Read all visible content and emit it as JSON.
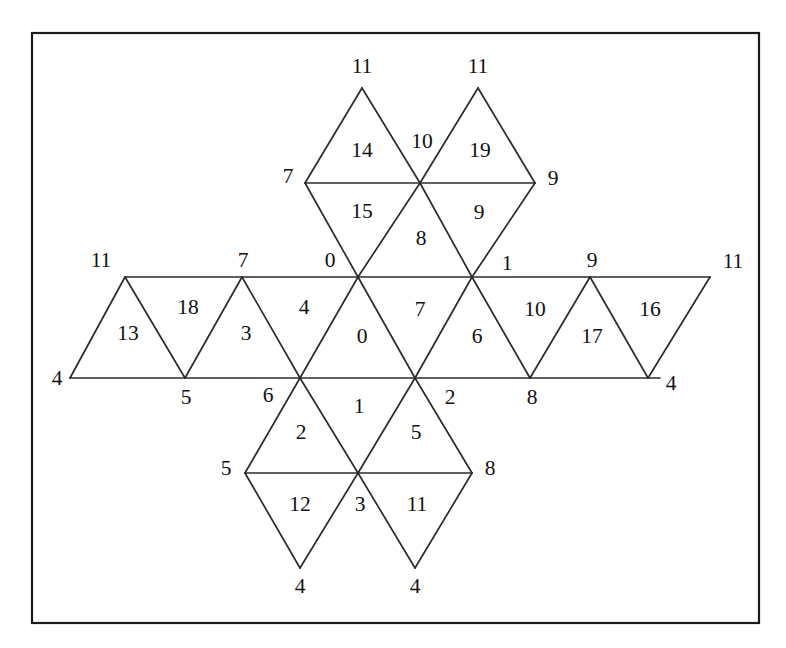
{
  "figure": {
    "type": "triangulated-mesh",
    "background_color": "#ffffff",
    "line_color": "#2b2b2b",
    "text_color": "#111111",
    "frame": {
      "x": 32,
      "y": 33,
      "width": 727,
      "height": 590
    }
  },
  "mesh_data": {
    "type": "diagram",
    "description": "Star-shaped triangulated mesh with numbered vertices (outside labels) and numbered triangular faces (inside labels)",
    "vertex_labels": [
      {
        "id": "v-top-left-apex",
        "text": "11",
        "x": 362,
        "y": 68
      },
      {
        "id": "v-top-right-apex",
        "text": "11",
        "x": 478,
        "y": 68
      },
      {
        "id": "v-upper-left",
        "text": "7",
        "x": 288,
        "y": 178
      },
      {
        "id": "v-upper-right",
        "text": "9",
        "x": 553,
        "y": 180
      },
      {
        "id": "v-strip-left-end-top",
        "text": "11",
        "x": 101,
        "y": 262
      },
      {
        "id": "v-strip-top-7",
        "text": "7",
        "x": 243,
        "y": 262
      },
      {
        "id": "v-center-top-left",
        "text": "0",
        "x": 330,
        "y": 262
      },
      {
        "id": "v-center-top-right",
        "text": "1",
        "x": 507,
        "y": 265
      },
      {
        "id": "v-strip-top-9",
        "text": "9",
        "x": 592,
        "y": 262
      },
      {
        "id": "v-strip-right-end-top",
        "text": "11",
        "x": 733,
        "y": 263
      },
      {
        "id": "v-strip-left-end-bot",
        "text": "4",
        "x": 57,
        "y": 380
      },
      {
        "id": "v-strip-bot-5",
        "text": "5",
        "x": 186,
        "y": 399
      },
      {
        "id": "v-strip-bot-6",
        "text": "6",
        "x": 268,
        "y": 397
      },
      {
        "id": "v-strip-bot-2",
        "text": "2",
        "x": 450,
        "y": 399
      },
      {
        "id": "v-strip-bot-8",
        "text": "8",
        "x": 532,
        "y": 399
      },
      {
        "id": "v-strip-right-end-bot",
        "text": "4",
        "x": 671,
        "y": 385
      },
      {
        "id": "v-lower-left",
        "text": "5",
        "x": 226,
        "y": 470
      },
      {
        "id": "v-lower-right",
        "text": "8",
        "x": 490,
        "y": 470
      },
      {
        "id": "v-bot-left-apex",
        "text": "4",
        "x": 300,
        "y": 588
      },
      {
        "id": "v-bot-right-apex",
        "text": "4",
        "x": 415,
        "y": 588
      }
    ],
    "face_labels": [
      {
        "id": "f-14",
        "text": "14",
        "x": 362,
        "y": 152
      },
      {
        "id": "f-10",
        "text": "10",
        "x": 422,
        "y": 143
      },
      {
        "id": "f-19",
        "text": "19",
        "x": 480,
        "y": 152
      },
      {
        "id": "f-15",
        "text": "15",
        "x": 362,
        "y": 213
      },
      {
        "id": "f-9",
        "text": "9",
        "x": 479,
        "y": 214
      },
      {
        "id": "f-8",
        "text": "8",
        "x": 421,
        "y": 240
      },
      {
        "id": "f-13",
        "text": "13",
        "x": 128,
        "y": 335
      },
      {
        "id": "f-18",
        "text": "18",
        "x": 188,
        "y": 309
      },
      {
        "id": "f-3",
        "text": "3",
        "x": 246,
        "y": 335
      },
      {
        "id": "f-4",
        "text": "4",
        "x": 304,
        "y": 309
      },
      {
        "id": "f-0",
        "text": "0",
        "x": 362,
        "y": 338
      },
      {
        "id": "f-7",
        "text": "7",
        "x": 420,
        "y": 311
      },
      {
        "id": "f-6",
        "text": "6",
        "x": 477,
        "y": 338
      },
      {
        "id": "f-10b",
        "text": "10",
        "x": 535,
        "y": 311
      },
      {
        "id": "f-17",
        "text": "17",
        "x": 592,
        "y": 338
      },
      {
        "id": "f-16",
        "text": "16",
        "x": 650,
        "y": 311
      },
      {
        "id": "f-2",
        "text": "2",
        "x": 301,
        "y": 434
      },
      {
        "id": "f-1",
        "text": "1",
        "x": 359,
        "y": 408
      },
      {
        "id": "f-5",
        "text": "5",
        "x": 416,
        "y": 434
      },
      {
        "id": "f-12",
        "text": "12",
        "x": 300,
        "y": 506
      },
      {
        "id": "f-3b",
        "text": "3",
        "x": 360,
        "y": 506
      },
      {
        "id": "f-11",
        "text": "11",
        "x": 417,
        "y": 506
      }
    ],
    "edges": [
      {
        "id": "e-strip-top",
        "x1": 125,
        "y1": 277,
        "x2": 710,
        "y2": 277
      },
      {
        "id": "e-strip-bot",
        "x1": 70,
        "y1": 378,
        "x2": 660,
        "y2": 378
      },
      {
        "id": "e-upper-mid",
        "x1": 305,
        "y1": 183,
        "x2": 535,
        "y2": 183
      },
      {
        "id": "e-lower-mid",
        "x1": 245,
        "y1": 473,
        "x2": 472,
        "y2": 473
      },
      {
        "id": "e-s1",
        "x1": 125,
        "y1": 277,
        "x2": 70,
        "y2": 378
      },
      {
        "id": "e-s2",
        "x1": 125,
        "y1": 277,
        "x2": 185,
        "y2": 378
      },
      {
        "id": "e-s3",
        "x1": 242,
        "y1": 277,
        "x2": 185,
        "y2": 378
      },
      {
        "id": "e-s4",
        "x1": 242,
        "y1": 277,
        "x2": 300,
        "y2": 378
      },
      {
        "id": "e-s5",
        "x1": 358,
        "y1": 277,
        "x2": 300,
        "y2": 378
      },
      {
        "id": "e-s6",
        "x1": 358,
        "y1": 277,
        "x2": 415,
        "y2": 378
      },
      {
        "id": "e-s7",
        "x1": 472,
        "y1": 277,
        "x2": 415,
        "y2": 378
      },
      {
        "id": "e-s8",
        "x1": 472,
        "y1": 277,
        "x2": 530,
        "y2": 378
      },
      {
        "id": "e-s9",
        "x1": 590,
        "y1": 277,
        "x2": 530,
        "y2": 378
      },
      {
        "id": "e-s10",
        "x1": 590,
        "y1": 277,
        "x2": 648,
        "y2": 378
      },
      {
        "id": "e-s11",
        "x1": 710,
        "y1": 277,
        "x2": 648,
        "y2": 378
      },
      {
        "id": "e-t1",
        "x1": 362,
        "y1": 88,
        "x2": 305,
        "y2": 183
      },
      {
        "id": "e-t2",
        "x1": 362,
        "y1": 88,
        "x2": 420,
        "y2": 183
      },
      {
        "id": "e-t3",
        "x1": 478,
        "y1": 88,
        "x2": 420,
        "y2": 183
      },
      {
        "id": "e-t4",
        "x1": 478,
        "y1": 88,
        "x2": 535,
        "y2": 183
      },
      {
        "id": "e-t5",
        "x1": 305,
        "y1": 183,
        "x2": 358,
        "y2": 277
      },
      {
        "id": "e-t6",
        "x1": 420,
        "y1": 183,
        "x2": 358,
        "y2": 277
      },
      {
        "id": "e-t7",
        "x1": 420,
        "y1": 183,
        "x2": 472,
        "y2": 277
      },
      {
        "id": "e-t8",
        "x1": 535,
        "y1": 183,
        "x2": 472,
        "y2": 277
      },
      {
        "id": "e-b1",
        "x1": 300,
        "y1": 378,
        "x2": 245,
        "y2": 473
      },
      {
        "id": "e-b2",
        "x1": 300,
        "y1": 378,
        "x2": 358,
        "y2": 473
      },
      {
        "id": "e-b3",
        "x1": 415,
        "y1": 378,
        "x2": 358,
        "y2": 473
      },
      {
        "id": "e-b4",
        "x1": 415,
        "y1": 378,
        "x2": 472,
        "y2": 473
      },
      {
        "id": "e-b5",
        "x1": 245,
        "y1": 473,
        "x2": 300,
        "y2": 568
      },
      {
        "id": "e-b6",
        "x1": 358,
        "y1": 473,
        "x2": 300,
        "y2": 568
      },
      {
        "id": "e-b7",
        "x1": 358,
        "y1": 473,
        "x2": 415,
        "y2": 568
      },
      {
        "id": "e-b8",
        "x1": 472,
        "y1": 473,
        "x2": 415,
        "y2": 568
      }
    ]
  }
}
